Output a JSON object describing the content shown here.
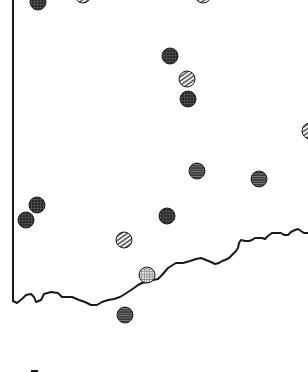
{
  "map": {
    "width": 308,
    "height": 372,
    "border_color": "#1a1a1a",
    "outline": {
      "west_border": [
        [
          13,
          0
        ],
        [
          13,
          301
        ]
      ],
      "coast": [
        [
          13,
          301
        ],
        [
          17,
          303
        ],
        [
          22,
          299
        ],
        [
          26,
          295
        ],
        [
          31,
          294
        ],
        [
          34,
          297
        ],
        [
          36,
          302
        ],
        [
          41,
          300
        ],
        [
          44,
          294
        ],
        [
          51,
          292
        ],
        [
          58,
          293
        ],
        [
          62,
          297
        ],
        [
          66,
          297
        ],
        [
          72,
          297
        ],
        [
          79,
          300
        ],
        [
          85,
          302
        ],
        [
          91,
          305
        ],
        [
          97,
          305
        ],
        [
          102,
          302
        ],
        [
          108,
          300
        ],
        [
          114,
          299
        ],
        [
          120,
          297
        ],
        [
          125,
          294
        ],
        [
          131,
          290
        ],
        [
          134,
          288
        ],
        [
          138,
          285
        ],
        [
          142,
          283
        ],
        [
          147,
          282
        ],
        [
          153,
          280
        ],
        [
          158,
          279
        ],
        [
          162,
          275
        ],
        [
          168,
          268
        ],
        [
          176,
          263
        ],
        [
          183,
          263
        ],
        [
          190,
          261
        ],
        [
          196,
          259
        ],
        [
          201,
          258
        ],
        [
          206,
          260
        ],
        [
          211,
          262
        ],
        [
          215,
          264
        ],
        [
          219,
          263
        ],
        [
          222,
          261
        ],
        [
          225,
          260
        ],
        [
          229,
          258
        ],
        [
          231,
          256
        ],
        [
          234,
          253
        ],
        [
          236,
          251
        ],
        [
          238,
          248
        ],
        [
          239,
          243
        ],
        [
          241,
          240
        ],
        [
          245,
          241
        ],
        [
          249,
          241
        ],
        [
          252,
          240
        ],
        [
          255,
          238
        ],
        [
          259,
          238
        ],
        [
          262,
          238
        ],
        [
          265,
          239
        ],
        [
          268,
          236
        ],
        [
          272,
          233
        ],
        [
          277,
          233
        ],
        [
          281,
          233
        ],
        [
          284,
          235
        ],
        [
          288,
          235
        ],
        [
          291,
          232
        ],
        [
          295,
          230
        ],
        [
          298,
          229
        ],
        [
          301,
          231
        ],
        [
          304,
          233
        ],
        [
          308,
          233
        ]
      ]
    },
    "legend_mark": {
      "x": 31,
      "y": 370,
      "width": 7,
      "height": 2
    },
    "markers": [
      {
        "id": "m1",
        "x": 38,
        "y": 2,
        "r": 8,
        "pattern": "dark-grid"
      },
      {
        "id": "m2",
        "x": 83,
        "y": -5,
        "r": 8,
        "pattern": "light-hatch"
      },
      {
        "id": "m3",
        "x": 203,
        "y": -5,
        "r": 8,
        "pattern": "light-hatch"
      },
      {
        "id": "m4",
        "x": 170,
        "y": 56,
        "r": 8,
        "pattern": "dark-grid"
      },
      {
        "id": "m5",
        "x": 187,
        "y": 79,
        "r": 8,
        "pattern": "light-hatch"
      },
      {
        "id": "m6",
        "x": 188,
        "y": 99,
        "r": 8,
        "pattern": "dark-grid"
      },
      {
        "id": "m7",
        "x": 310,
        "y": 131,
        "r": 8,
        "pattern": "light-hatch"
      },
      {
        "id": "m8",
        "x": 197,
        "y": 171,
        "r": 8,
        "pattern": "dark-fine"
      },
      {
        "id": "m9",
        "x": 259,
        "y": 179,
        "r": 8,
        "pattern": "dark-fine"
      },
      {
        "id": "m10",
        "x": 37,
        "y": 205,
        "r": 8,
        "pattern": "dark-grid"
      },
      {
        "id": "m11",
        "x": 26,
        "y": 220,
        "r": 8,
        "pattern": "dark-grid"
      },
      {
        "id": "m12",
        "x": 167,
        "y": 216,
        "r": 8,
        "pattern": "dark-grid"
      },
      {
        "id": "m13",
        "x": 124,
        "y": 240,
        "r": 8,
        "pattern": "light-hatch"
      },
      {
        "id": "m14",
        "x": 147,
        "y": 275,
        "r": 8,
        "pattern": "light-grid"
      },
      {
        "id": "m15",
        "x": 125,
        "y": 315,
        "r": 8,
        "pattern": "dark-fine"
      }
    ],
    "patterns": {
      "dark-grid": {
        "fill": "#2b2b2b",
        "line": "#5a5a5a",
        "type": "grid"
      },
      "dark-fine": {
        "fill": "#3c3c3c",
        "line": "#777777",
        "type": "hlines"
      },
      "light-hatch": {
        "fill": "#ffffff",
        "line": "#555555",
        "type": "diagonal"
      },
      "light-grid": {
        "fill": "#e8e8e8",
        "line": "#777777",
        "type": "grid"
      }
    }
  }
}
